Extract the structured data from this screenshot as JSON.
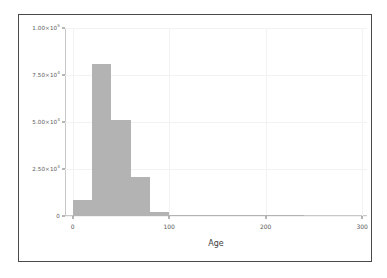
{
  "figure": {
    "background_color": "#ffffff",
    "border_color": "#4a4a4a",
    "bar_color": "#b3b3b3",
    "grid_color": "#f2f2f2",
    "axis_color": "#c8c8c8",
    "tick_label_color": "#5a5a5a"
  },
  "chart_data": {
    "type": "bar",
    "title": "",
    "subtitle": "",
    "xlabel": "Age",
    "ylabel": "",
    "grid": true,
    "legend": null,
    "xlim": [
      -8,
      305
    ],
    "ylim": [
      0,
      100000
    ],
    "bin_width": 20,
    "x_ticks": [
      0,
      100,
      200,
      300
    ],
    "x_tick_labels": [
      "0",
      "100",
      "200",
      "300"
    ],
    "y_ticks": [
      0,
      25000,
      50000,
      75000,
      100000
    ],
    "y_tick_labels": [
      "0",
      "2.50×10",
      "5.00×10",
      "7.50×10",
      "1.00×10"
    ],
    "y_tick_exponents": [
      "",
      "4",
      "4",
      "4",
      "5"
    ],
    "categories": [
      "0-20",
      "20-40",
      "40-60",
      "60-80",
      "80-100",
      "100-120",
      "120-140",
      "140-160",
      "160-180",
      "180-200",
      "200-220",
      "220-240"
    ],
    "bin_starts": [
      0,
      20,
      40,
      60,
      80,
      100,
      120,
      140,
      160,
      180,
      200,
      220
    ],
    "values": [
      8500,
      81000,
      51000,
      21000,
      2000,
      400,
      250,
      180,
      120,
      90,
      70,
      50
    ]
  }
}
